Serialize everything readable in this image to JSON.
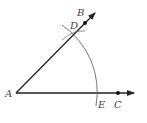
{
  "diagram": {
    "points": {
      "A": {
        "label": "A",
        "x": 16,
        "y": 93
      },
      "B": {
        "label": "B",
        "x": 85,
        "y": 23
      },
      "C": {
        "label": "C",
        "x": 118,
        "y": 93
      },
      "D": {
        "label": "D",
        "x": 73,
        "y": 35
      },
      "E": {
        "label": "E",
        "x": 96,
        "y": 93
      }
    },
    "rays": [
      {
        "name": "ray-AB",
        "from": "A",
        "through": "B"
      },
      {
        "name": "ray-AC",
        "from": "A",
        "through": "C"
      }
    ],
    "arc": {
      "center": "A",
      "passes_through": [
        "D",
        "E"
      ]
    },
    "colors": {
      "line": "#222222",
      "arc": "#555555",
      "label": "#444444"
    }
  }
}
